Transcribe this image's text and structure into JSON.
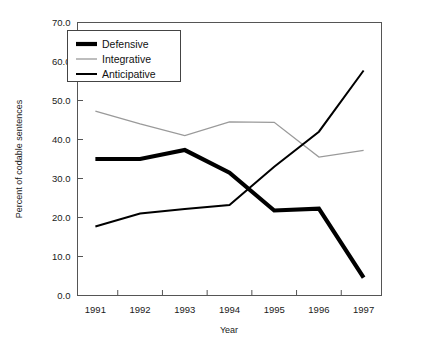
{
  "chart_data": {
    "type": "line",
    "title": "",
    "xlabel": "Year",
    "ylabel": "Percent of codable sentences",
    "categories": [
      "1991",
      "1992",
      "1993",
      "1994",
      "1995",
      "1996",
      "1997"
    ],
    "x": [
      1991,
      1992,
      1993,
      1994,
      1995,
      1996,
      1997
    ],
    "xlim": [
      1990.6,
      1997.4
    ],
    "ylim": [
      0.0,
      70.0
    ],
    "yticks": [
      "0.0",
      "10.0",
      "20.0",
      "30.0",
      "40.0",
      "50.0",
      "60.0",
      "70.0"
    ],
    "ytick_values": [
      0.0,
      10.0,
      20.0,
      30.0,
      40.0,
      50.0,
      60.0,
      70.0
    ],
    "grid": false,
    "legend_position": "upper-left-inside",
    "series": [
      {
        "name": "Defensive",
        "values": [
          35.0,
          35.0,
          37.3,
          31.5,
          21.8,
          22.3,
          4.6
        ],
        "color": "#000000",
        "line_width": 4.2
      },
      {
        "name": "Integrative",
        "values": [
          47.3,
          44.0,
          41.0,
          44.5,
          44.4,
          35.5,
          37.2
        ],
        "color": "#9a9a9a",
        "line_width": 1.3
      },
      {
        "name": "Anticipative",
        "values": [
          17.7,
          21.0,
          22.2,
          23.2,
          33.0,
          42.0,
          57.7
        ],
        "color": "#000000",
        "line_width": 2.0
      }
    ]
  },
  "frame": {
    "border_color": "#555555",
    "plot_background": "#ffffff"
  },
  "legend": {
    "items": [
      {
        "label": "Defensive"
      },
      {
        "label": "Integrative"
      },
      {
        "label": "Anticipative"
      }
    ]
  }
}
